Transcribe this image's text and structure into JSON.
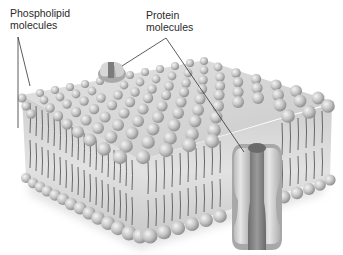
{
  "figure": {
    "type": "cell membrane diagram",
    "labels": {
      "phospholipid": "Phospholipid\nmolecules",
      "protein": "Protein\nmolecules"
    },
    "colors": {
      "head_light": "#e8e8e8",
      "head_mid": "#bdbdbd",
      "head_dark": "#8e8e8e",
      "tail": "#555555",
      "core": "#d9d9d9",
      "protein_outer": "#cfcfcf",
      "protein_inner": "#7a7a7a",
      "leader": "#333333"
    }
  }
}
